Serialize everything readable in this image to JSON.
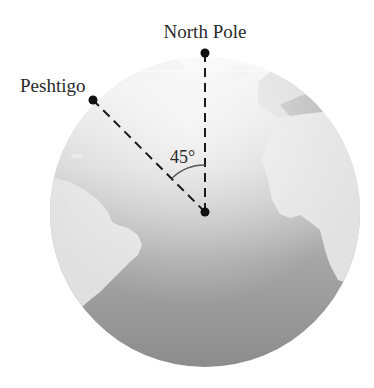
{
  "diagram": {
    "labels": {
      "north_pole": "North Pole",
      "peshtigo": "Peshtigo",
      "angle": "45°"
    },
    "angle_degrees": 45,
    "colors": {
      "ocean_light": "#f2f2f2",
      "ocean_dark": "#8e8e8e",
      "land": "#e2e2e2",
      "land_dark": "#b4b4b4",
      "line": "#1a1a1a"
    }
  }
}
